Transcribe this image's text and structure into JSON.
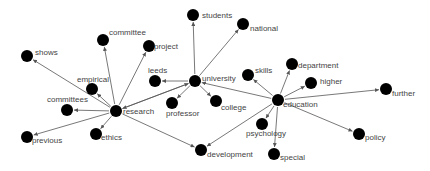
{
  "diagram": {
    "type": "network",
    "node_radius": 6,
    "colors": {
      "node": "#000000",
      "edge": "#555555",
      "label": "#444444",
      "background": "#ffffff"
    },
    "nodes": [
      {
        "id": "students",
        "label": "students",
        "x": 193,
        "y": 15,
        "lx": 9,
        "ly": 3
      },
      {
        "id": "national",
        "label": "national",
        "x": 243,
        "y": 24,
        "lx": 7,
        "ly": 7
      },
      {
        "id": "committee",
        "label": "committee",
        "x": 103,
        "y": 40,
        "lx": 6,
        "ly": -5
      },
      {
        "id": "project",
        "label": "project",
        "x": 149,
        "y": 46,
        "lx": 5,
        "ly": 3
      },
      {
        "id": "shows",
        "label": "shows",
        "x": 27,
        "y": 56,
        "lx": 8,
        "ly": -1
      },
      {
        "id": "leeds",
        "label": "leeds",
        "x": 155,
        "y": 81,
        "lx": -7,
        "ly": -8
      },
      {
        "id": "university",
        "label": "university",
        "x": 195,
        "y": 81,
        "lx": 7,
        "ly": 0
      },
      {
        "id": "empirical",
        "label": "empirical",
        "x": 92,
        "y": 89,
        "lx": -15,
        "ly": -7
      },
      {
        "id": "skills",
        "label": "skills",
        "x": 248,
        "y": 75,
        "lx": 7,
        "ly": -2
      },
      {
        "id": "department",
        "label": "department",
        "x": 292,
        "y": 64,
        "lx": 6,
        "ly": 4
      },
      {
        "id": "higher",
        "label": "higher",
        "x": 311,
        "y": 83,
        "lx": 9,
        "ly": 1
      },
      {
        "id": "further",
        "label": "further",
        "x": 386,
        "y": 89,
        "lx": 6,
        "ly": 7
      },
      {
        "id": "committees",
        "label": "committees",
        "x": 67,
        "y": 110,
        "lx": -20,
        "ly": -8
      },
      {
        "id": "research",
        "label": "research",
        "x": 116,
        "y": 111,
        "lx": 7,
        "ly": 3
      },
      {
        "id": "professor",
        "label": "professor",
        "x": 172,
        "y": 103,
        "lx": -6,
        "ly": 13
      },
      {
        "id": "college",
        "label": "college",
        "x": 216,
        "y": 101,
        "lx": 5,
        "ly": 9
      },
      {
        "id": "education",
        "label": "education",
        "x": 278,
        "y": 100,
        "lx": 5,
        "ly": 7
      },
      {
        "id": "psychology",
        "label": "psychology",
        "x": 262,
        "y": 124,
        "lx": -16,
        "ly": 12
      },
      {
        "id": "previous",
        "label": "previous",
        "x": 27,
        "y": 137,
        "lx": 5,
        "ly": 6
      },
      {
        "id": "ethics",
        "label": "ethics",
        "x": 96,
        "y": 134,
        "lx": 5,
        "ly": 6
      },
      {
        "id": "policy",
        "label": "policy",
        "x": 359,
        "y": 134,
        "lx": 6,
        "ly": 6
      },
      {
        "id": "development",
        "label": "development",
        "x": 201,
        "y": 150,
        "lx": 6,
        "ly": 7
      },
      {
        "id": "special",
        "label": "special",
        "x": 274,
        "y": 154,
        "lx": 6,
        "ly": 6
      }
    ],
    "edges": [
      {
        "from": "university",
        "to": "students"
      },
      {
        "from": "university",
        "to": "national"
      },
      {
        "from": "university",
        "to": "leeds"
      },
      {
        "from": "university",
        "to": "professor"
      },
      {
        "from": "university",
        "to": "college"
      },
      {
        "from": "university",
        "to": "research"
      },
      {
        "from": "education",
        "to": "university"
      },
      {
        "from": "education",
        "to": "skills"
      },
      {
        "from": "education",
        "to": "department"
      },
      {
        "from": "education",
        "to": "higher"
      },
      {
        "from": "education",
        "to": "further"
      },
      {
        "from": "education",
        "to": "policy"
      },
      {
        "from": "education",
        "to": "psychology"
      },
      {
        "from": "education",
        "to": "special"
      },
      {
        "from": "education",
        "to": "development"
      },
      {
        "from": "research",
        "to": "committee"
      },
      {
        "from": "research",
        "to": "project"
      },
      {
        "from": "research",
        "to": "shows"
      },
      {
        "from": "research",
        "to": "empirical"
      },
      {
        "from": "research",
        "to": "committees"
      },
      {
        "from": "research",
        "to": "previous"
      },
      {
        "from": "research",
        "to": "ethics"
      },
      {
        "from": "research",
        "to": "development"
      },
      {
        "from": "research",
        "to": "university"
      }
    ]
  }
}
